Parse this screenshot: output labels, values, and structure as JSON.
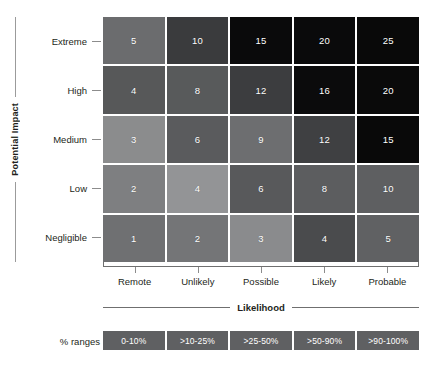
{
  "axes": {
    "y_title": "Potential Impact",
    "x_title": "Likelihood",
    "y_categories": [
      "Extreme",
      "High",
      "Medium",
      "Low",
      "Negligible"
    ],
    "x_categories": [
      "Remote",
      "Unlikely",
      "Possible",
      "Likely",
      "Probable"
    ]
  },
  "legend": {
    "label": "% ranges",
    "items": [
      {
        "text": "0-10%",
        "color": "#5f6062"
      },
      {
        "text": ">10-25%",
        "color": "#5f6062"
      },
      {
        "text": ">25-50%",
        "color": "#5f6062"
      },
      {
        "text": ">50-90%",
        "color": "#5f6062"
      },
      {
        "text": ">90-100%",
        "color": "#5f6062"
      }
    ]
  },
  "chart_data": {
    "type": "heatmap",
    "title": "",
    "subtitle": "",
    "xlabel": "Likelihood",
    "ylabel": "Potential Impact",
    "x": [
      "Remote",
      "Unlikely",
      "Possible",
      "Likely",
      "Probable"
    ],
    "y": [
      "Extreme",
      "High",
      "Medium",
      "Low",
      "Negligible"
    ],
    "grid": false,
    "legend_position": "bottom",
    "colorscale": "grayscale-dark-is-high-risk",
    "values": [
      [
        5,
        10,
        15,
        20,
        25
      ],
      [
        4,
        8,
        12,
        16,
        20
      ],
      [
        3,
        6,
        9,
        12,
        15
      ],
      [
        2,
        4,
        6,
        8,
        10
      ],
      [
        1,
        2,
        3,
        4,
        5
      ]
    ],
    "cell_colors": [
      [
        "#6b6c6e",
        "#3a3b3d",
        "#0a0a0b",
        "#0a0a0b",
        "#090909"
      ],
      [
        "#575859",
        "#585a5b",
        "#3c3d3f",
        "#0b0b0c",
        "#0a0a0a"
      ],
      [
        "#8b8c8d",
        "#5a5b5d",
        "#6d6e70",
        "#3f4042",
        "#090909"
      ],
      [
        "#7e7f81",
        "#939496",
        "#58595b",
        "#5c5d5f",
        "#5e5f61"
      ],
      [
        "#6f7072",
        "#747577",
        "#8a8b8d",
        "#4a4b4d",
        "#606163"
      ]
    ],
    "cells": [
      {
        "y": "Extreme",
        "x": "Remote",
        "value": 5,
        "color": "#6b6c6e"
      },
      {
        "y": "Extreme",
        "x": "Unlikely",
        "value": 10,
        "color": "#3a3b3d"
      },
      {
        "y": "Extreme",
        "x": "Possible",
        "value": 15,
        "color": "#0a0a0b"
      },
      {
        "y": "Extreme",
        "x": "Likely",
        "value": 20,
        "color": "#0a0a0b"
      },
      {
        "y": "Extreme",
        "x": "Probable",
        "value": 25,
        "color": "#090909"
      },
      {
        "y": "High",
        "x": "Remote",
        "value": 4,
        "color": "#575859"
      },
      {
        "y": "High",
        "x": "Unlikely",
        "value": 8,
        "color": "#585a5b"
      },
      {
        "y": "High",
        "x": "Possible",
        "value": 12,
        "color": "#3c3d3f"
      },
      {
        "y": "High",
        "x": "Likely",
        "value": 16,
        "color": "#0b0b0c"
      },
      {
        "y": "High",
        "x": "Probable",
        "value": 20,
        "color": "#0a0a0a"
      },
      {
        "y": "Medium",
        "x": "Remote",
        "value": 3,
        "color": "#8b8c8d"
      },
      {
        "y": "Medium",
        "x": "Unlikely",
        "value": 6,
        "color": "#5a5b5d"
      },
      {
        "y": "Medium",
        "x": "Possible",
        "value": 9,
        "color": "#6d6e70"
      },
      {
        "y": "Medium",
        "x": "Likely",
        "value": 12,
        "color": "#3f4042"
      },
      {
        "y": "Medium",
        "x": "Probable",
        "value": 15,
        "color": "#090909"
      },
      {
        "y": "Low",
        "x": "Remote",
        "value": 2,
        "color": "#7e7f81"
      },
      {
        "y": "Low",
        "x": "Unlikely",
        "value": 4,
        "color": "#939496"
      },
      {
        "y": "Low",
        "x": "Possible",
        "value": 6,
        "color": "#58595b"
      },
      {
        "y": "Low",
        "x": "Likely",
        "value": 8,
        "color": "#5c5d5f"
      },
      {
        "y": "Low",
        "x": "Probable",
        "value": 10,
        "color": "#5e5f61"
      },
      {
        "y": "Negligible",
        "x": "Remote",
        "value": 1,
        "color": "#6f7072"
      },
      {
        "y": "Negligible",
        "x": "Unlikely",
        "value": 2,
        "color": "#747577"
      },
      {
        "y": "Negligible",
        "x": "Possible",
        "value": 3,
        "color": "#8a8b8d"
      },
      {
        "y": "Negligible",
        "x": "Likely",
        "value": 4,
        "color": "#4a4b4d"
      },
      {
        "y": "Negligible",
        "x": "Probable",
        "value": 5,
        "color": "#606163"
      }
    ]
  }
}
